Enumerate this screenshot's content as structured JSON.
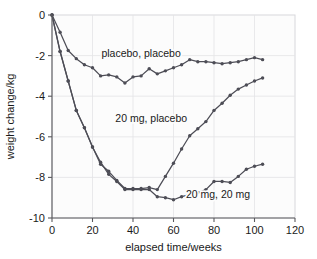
{
  "chart_data": {
    "type": "line",
    "title": "",
    "xlabel": "elapsed time/weeks",
    "ylabel": "weight change/kg",
    "xlim": [
      0,
      120
    ],
    "ylim": [
      -10,
      0
    ],
    "xticks": [
      0,
      20,
      40,
      60,
      80,
      100,
      120
    ],
    "yticks": [
      0,
      -2,
      -4,
      -6,
      -8,
      -10
    ],
    "xtick_labels": [
      "0",
      "20",
      "40",
      "60",
      "80",
      "100",
      "120"
    ],
    "ytick_labels": [
      "0",
      "-2",
      "-4",
      "-6",
      "-8",
      "-10"
    ],
    "grid": true,
    "legend_position": "inline-annotations",
    "line_color": "#4d4d56",
    "marker_color": "#4d4d56",
    "background_color": "#fcfcfc",
    "gridline_color": "#e3e3e6",
    "series": [
      {
        "name": "placebo, placebo",
        "label_x": 44,
        "label_y": -2.05,
        "x": [
          0,
          4,
          8,
          12,
          16,
          20,
          24,
          28,
          32,
          36,
          40,
          44,
          48,
          52,
          56,
          60,
          64,
          68,
          72,
          76,
          80,
          84,
          88,
          92,
          96,
          100,
          104
        ],
        "y": [
          0,
          -0.85,
          -1.75,
          -2.15,
          -2.45,
          -2.6,
          -3.0,
          -2.95,
          -3.05,
          -3.35,
          -3.05,
          -3.0,
          -2.65,
          -2.9,
          -2.75,
          -2.6,
          -2.45,
          -2.2,
          -2.3,
          -2.3,
          -2.35,
          -2.4,
          -2.35,
          -2.3,
          -2.2,
          -2.1,
          -2.2
        ]
      },
      {
        "name": "20 mg, placebo",
        "label_x": 49,
        "label_y": -5.25,
        "x": [
          0,
          4,
          8,
          12,
          16,
          20,
          24,
          28,
          32,
          36,
          40,
          44,
          48,
          52,
          56,
          60,
          64,
          68,
          72,
          76,
          80,
          84,
          88,
          92,
          96,
          100,
          104
        ],
        "y": [
          0,
          -1.8,
          -3.25,
          -4.7,
          -5.55,
          -6.5,
          -7.35,
          -7.7,
          -8.15,
          -8.55,
          -8.55,
          -8.55,
          -8.5,
          -8.6,
          -7.95,
          -7.3,
          -6.6,
          -5.95,
          -5.6,
          -5.25,
          -4.7,
          -4.35,
          -3.95,
          -3.65,
          -3.45,
          -3.25,
          -3.1
        ]
      },
      {
        "name": "20 mg, 20 mg",
        "label_x": 82,
        "label_y": -9.0,
        "x": [
          0,
          4,
          8,
          12,
          16,
          20,
          24,
          28,
          32,
          36,
          40,
          44,
          48,
          52,
          56,
          60,
          64,
          68,
          72,
          76,
          80,
          84,
          88,
          92,
          96,
          100,
          104
        ],
        "y": [
          0,
          -1.8,
          -3.25,
          -4.7,
          -5.55,
          -6.5,
          -7.25,
          -7.85,
          -8.2,
          -8.6,
          -8.6,
          -8.6,
          -8.6,
          -8.95,
          -9.0,
          -9.1,
          -8.95,
          -8.85,
          -8.75,
          -8.6,
          -8.2,
          -8.2,
          -8.25,
          -7.95,
          -7.6,
          -7.45,
          -7.35
        ]
      }
    ]
  }
}
